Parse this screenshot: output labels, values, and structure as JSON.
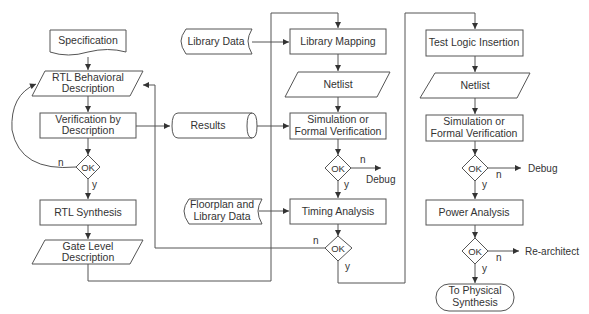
{
  "diagram": {
    "type": "flowchart",
    "title": "",
    "column1": {
      "specification": "Specification",
      "rtl_behavioral": [
        "RTL Behavioral",
        "Description"
      ],
      "verification": [
        "Verification by",
        "Description"
      ],
      "ok": "OK",
      "n": "n",
      "y": "y",
      "rtl_synthesis": "RTL Synthesis",
      "gate_level": [
        "Gate Level",
        "Description"
      ]
    },
    "inputs": {
      "library_data": "Library Data",
      "results": "Results",
      "floorplan": [
        "Floorplan and",
        "Library Data"
      ]
    },
    "column2": {
      "library_mapping": "Library Mapping",
      "netlist": "Netlist",
      "simulation": [
        "Simulation or",
        "Formal Verification"
      ],
      "ok1": "OK",
      "n1": "n",
      "y1": "y",
      "debug": "Debug",
      "timing": "Timing Analysis",
      "ok2": "OK",
      "n2": "n",
      "y2": "y"
    },
    "column3": {
      "test_logic": "Test Logic Insertion",
      "netlist": "Netlist",
      "simulation": [
        "Simulation or",
        "Formal Verification"
      ],
      "ok1": "OK",
      "n1": "n",
      "y1": "y",
      "debug": "Debug",
      "power": "Power Analysis",
      "ok2": "OK",
      "n2": "n",
      "y2": "y",
      "rearchitect": "Re-architect",
      "physical": [
        "To Physical",
        "Synthesis"
      ]
    }
  }
}
